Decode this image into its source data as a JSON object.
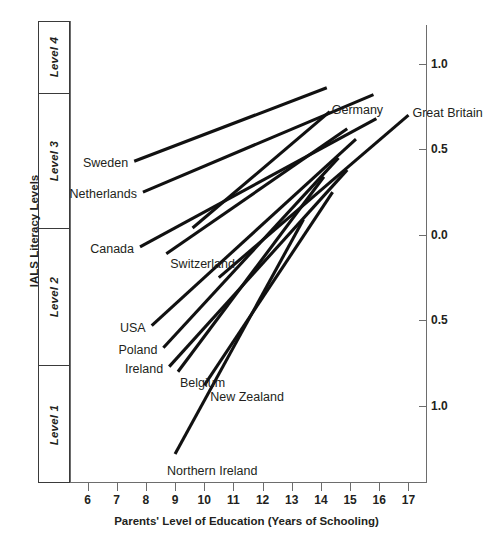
{
  "chart_data": {
    "type": "line",
    "title": "",
    "xlabel": "Parents' Level of Education (Years of Schooling)",
    "ylabel_right": "Literacy Scores in Standard Deviation Units",
    "ylabel_left": "IALS Literacy Levels",
    "xlim": [
      5.4,
      17.6
    ],
    "ylim": [
      -1.45,
      1.25
    ],
    "xticks": [
      6,
      7,
      8,
      9,
      10,
      11,
      12,
      13,
      14,
      15,
      16,
      17
    ],
    "xtick_labels": [
      "6",
      "7",
      "8",
      "9",
      "10",
      "11",
      "12",
      "13",
      "14",
      "15",
      "16",
      "17"
    ],
    "yticks": [
      1.0,
      0.5,
      0.0,
      -0.5,
      -1.0
    ],
    "ytick_labels": [
      "1.0",
      "0.5",
      "0.0",
      "0.5",
      "1.0"
    ],
    "grid": false,
    "legend_position": "inline-endpoint-labels",
    "level_bands": [
      {
        "label": "Level 4",
        "y_top": 1.25,
        "y_bottom": 0.83
      },
      {
        "label": "Level 3",
        "y_top": 0.83,
        "y_bottom": 0.04
      },
      {
        "label": "Level 2",
        "y_top": 0.04,
        "y_bottom": -0.76
      },
      {
        "label": "Level 1",
        "y_top": -0.76,
        "y_bottom": -1.45
      }
    ],
    "series": [
      {
        "name": "Sweden",
        "label_side": "left",
        "x": [
          7.6,
          14.2
        ],
        "y": [
          0.43,
          0.86
        ]
      },
      {
        "name": "Netherlands",
        "label_side": "left",
        "x": [
          7.9,
          15.8
        ],
        "y": [
          0.25,
          0.82
        ]
      },
      {
        "name": "Germany",
        "label_side": "right",
        "x": [
          9.6,
          14.3
        ],
        "y": [
          0.04,
          0.72
        ]
      },
      {
        "name": "Canada",
        "label_side": "left",
        "x": [
          7.8,
          15.9
        ],
        "y": [
          -0.07,
          0.68
        ]
      },
      {
        "name": "Switzerland",
        "label_side": "left",
        "x": [
          8.7,
          14.9
        ],
        "y": [
          -0.11,
          0.62
        ]
      },
      {
        "name": "Great Britain",
        "label_side": "right",
        "x": [
          10.5,
          17.0
        ],
        "y": [
          -0.25,
          0.7
        ]
      },
      {
        "name": "USA",
        "label_side": "left",
        "x": [
          8.2,
          15.2
        ],
        "y": [
          -0.53,
          0.56
        ]
      },
      {
        "name": "Poland",
        "label_side": "left",
        "x": [
          8.6,
          14.6
        ],
        "y": [
          -0.66,
          0.45
        ]
      },
      {
        "name": "Ireland",
        "label_side": "left",
        "x": [
          8.8,
          14.9
        ],
        "y": [
          -0.77,
          0.38
        ]
      },
      {
        "name": "Belgium",
        "label_side": "left",
        "x": [
          9.1,
          14.1
        ],
        "y": [
          -0.8,
          0.34
        ]
      },
      {
        "name": "New Zealand",
        "label_side": "left",
        "x": [
          10.0,
          14.4
        ],
        "y": [
          -0.88,
          0.25
        ]
      },
      {
        "name": "Northern Ireland",
        "label_side": "left",
        "x": [
          9.0,
          13.4
        ],
        "y": [
          -1.28,
          0.09
        ]
      }
    ]
  },
  "caption": {
    "text": ""
  }
}
